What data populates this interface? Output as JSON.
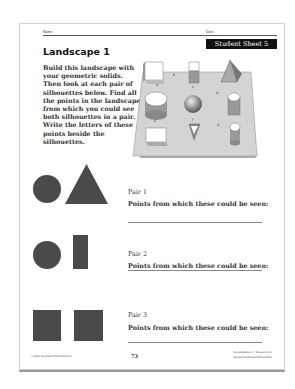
{
  "header": {
    "name_label": "Name",
    "date_label": "Date",
    "sheet_badge": "Student Sheet 5"
  },
  "title": "Landscape 1",
  "instructions": "Build this landscape with your geometric solids. Then look at each pair of silhouettes below. Find all the points in the landscape from which you could see both silhouettes in a pair. Write the letters of these points beside the silhouettes.",
  "landscape": {
    "point_labels": [
      "A",
      "B",
      "C",
      "D",
      "E",
      "F",
      "G"
    ]
  },
  "pairs": [
    {
      "title": "Pair 1",
      "prompt": "Points from which these could be seen:",
      "silhouettes": [
        "circle",
        "triangle"
      ]
    },
    {
      "title": "Pair 2",
      "prompt": "Points from which these could be seen:",
      "silhouettes": [
        "circle",
        "tall-rectangle"
      ]
    },
    {
      "title": "Pair 3",
      "prompt": "Points from which these could be seen:",
      "silhouettes": [
        "square",
        "square"
      ]
    }
  ],
  "footer": {
    "copyright": "© Dale Seymour Publications®",
    "page_number": "73",
    "investigation": "Investigation 2 • Sessions 1-2",
    "unit": "Seeing Solids and Silhouettes"
  }
}
